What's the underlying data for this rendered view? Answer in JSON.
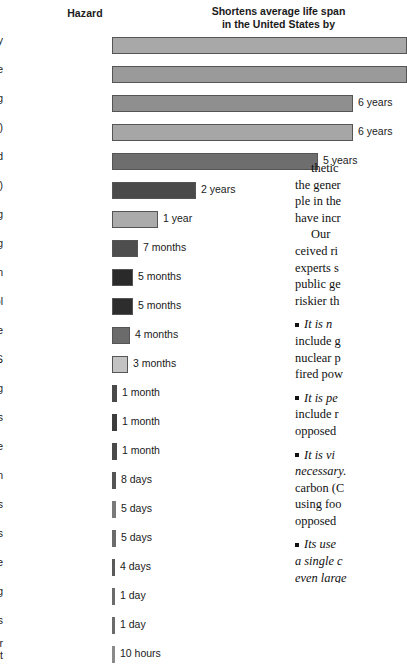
{
  "header": {
    "hazard_label": "Hazard",
    "shortens_line1": "Shortens average life span",
    "shortens_line2": "in the United States by"
  },
  "chart_data": {
    "type": "bar",
    "title": "Shortens average life span in the United States by",
    "xlabel": "",
    "ylabel": "Hazard",
    "orientation": "horizontal",
    "grid": false,
    "legend": null,
    "categories": [
      "Poverty",
      "Born male",
      "Smoking",
      "Overweight (35%)",
      "Unmarried",
      "Overweight (15%)",
      "Spouse smoking",
      "Driving",
      "Air pollution",
      "Alcohol",
      "Drug abuse",
      "AIDS",
      "Drowning",
      "Pesticides",
      "Fire",
      "Natural radiation",
      "Medical X rays",
      "Oral contraceptives",
      "Toxic waste",
      "Flying",
      "Hurricanes, tornadoes",
      "Living lifetime near\nnuclear plant"
    ],
    "value_labels": [
      "",
      "",
      "6 years",
      "6 years",
      "5 years",
      "2 years",
      "1 year",
      "7 months",
      "5 months",
      "5 months",
      "4 months",
      "3 months",
      "1 month",
      "1 month",
      "1 month",
      "8 days",
      "5 days",
      "5 days",
      "4 days",
      "1 day",
      "1 day",
      "10 hours"
    ],
    "values_days": [
      3285,
      3285,
      2190,
      2190,
      1825,
      730,
      365,
      213,
      152,
      152,
      122,
      91,
      30,
      30,
      30,
      8,
      5,
      5,
      4,
      1,
      1,
      0.42
    ],
    "bar_pixel_widths": [
      295,
      295,
      241,
      241,
      206,
      84,
      46,
      26,
      21,
      21,
      18,
      16,
      5,
      5,
      5,
      4,
      4,
      4,
      3,
      3,
      3,
      3
    ],
    "bar_colors": [
      "#a8a8a8",
      "#9a9a9a",
      "#8f8f8f",
      "#a6a6a6",
      "#6e6e6e",
      "#4a4a4a",
      "#ababab",
      "#4e4e4e",
      "#2a2a2a",
      "#2d2d2d",
      "#6b6b6b",
      "#c3c3c3",
      "#4a4a4a",
      "#3d3d3d",
      "#4a4a4a",
      "#555555",
      "#7a7a7a",
      "#6b6b6b",
      "#5a5a5a",
      "#6b6b6b",
      "#6b6b6b",
      "#8a8a8a"
    ]
  },
  "body_text": {
    "p1": "thetic",
    "p2": "the gener",
    "p3": "ple in the",
    "p4": "have incr",
    "p5": "Our",
    "p6": "ceived ri",
    "p7": "experts s",
    "p8": "public ge",
    "p9": "riskier th",
    "b1_italic": "It is n",
    "b1_l2": "include g",
    "b1_l3": "nuclear p",
    "b1_l4": "fired pow",
    "b2_italic": "It is pe",
    "b2_l2": "include r",
    "b2_l3": "opposed",
    "b3_italic": "It is vi",
    "b3_l2": "necessary.",
    "b3_l3": "carbon (C",
    "b3_l4": "using foo",
    "b3_l5": "opposed",
    "b4_italic": "Its use",
    "b4_l2": "a single c",
    "b4_l3": "even large",
    "b4_l4": "ples migh"
  }
}
